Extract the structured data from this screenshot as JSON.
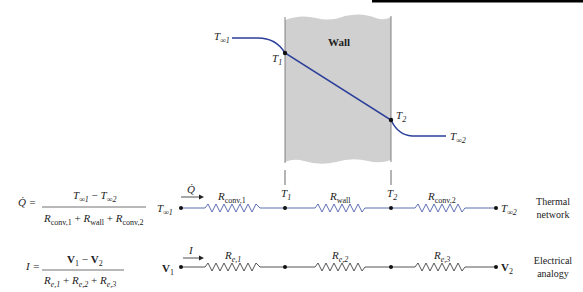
{
  "top_bar": {
    "color": "#000000"
  },
  "wall_figure": {
    "wall_label": "Wall",
    "wall_fill": "#d0d0d0",
    "curve_color": "#2b3f9a",
    "labels": {
      "t_inf1_main": "T",
      "t_inf1_sub": "∞1",
      "t1_main": "T",
      "t1_sub": "1",
      "t2_main": "T",
      "t2_sub": "2",
      "t_inf2_main": "T",
      "t_inf2_sub": "∞2"
    }
  },
  "thermal_network": {
    "equation": {
      "lhs": "Q̇ =",
      "numerator": {
        "a_main": "T",
        "a_sub": "∞1",
        "minus": " − ",
        "b_main": "T",
        "b_sub": "∞2"
      },
      "denominator": {
        "r1_main": "R",
        "r1_sub": "conv,1",
        "plus1": " + ",
        "r2_main": "R",
        "r2_sub": "wall",
        "plus2": " + ",
        "r3_main": "R",
        "r3_sub": "conv,2"
      }
    },
    "left_node": {
      "main": "T",
      "sub": "∞1"
    },
    "flow_label": "Q̇",
    "resistors": [
      {
        "main": "R",
        "sub": "conv,1"
      },
      {
        "main": "R",
        "sub": "wall"
      },
      {
        "main": "R",
        "sub": "conv,2"
      }
    ],
    "nodes": [
      {
        "main": "T",
        "sub": "1"
      },
      {
        "main": "T",
        "sub": "2"
      }
    ],
    "right_node": {
      "main": "T",
      "sub": "∞2"
    },
    "caption_line1": "Thermal",
    "caption_line2": "network",
    "line_color": "#5b6fb0"
  },
  "electrical_analogy": {
    "equation": {
      "lhs": "I =",
      "numerator": {
        "a_main": "V",
        "a_sub": "1",
        "minus": " − ",
        "b_main": "V",
        "b_sub": "2"
      },
      "denominator": {
        "r1_main": "R",
        "r1_sub": "e,1",
        "plus1": " + ",
        "r2_main": "R",
        "r2_sub": "e,2",
        "plus2": " + ",
        "r3_main": "R",
        "r3_sub": "e,3"
      }
    },
    "left_node": {
      "main": "V",
      "sub": "1"
    },
    "flow_label": "I",
    "resistors": [
      {
        "main": "R",
        "sub": "e,1"
      },
      {
        "main": "R",
        "sub": "e,2"
      },
      {
        "main": "R",
        "sub": "e,3"
      }
    ],
    "right_node": {
      "main": "V",
      "sub": "2"
    },
    "caption_line1": "Electrical",
    "caption_line2": "analogy",
    "line_color": "#555555"
  }
}
